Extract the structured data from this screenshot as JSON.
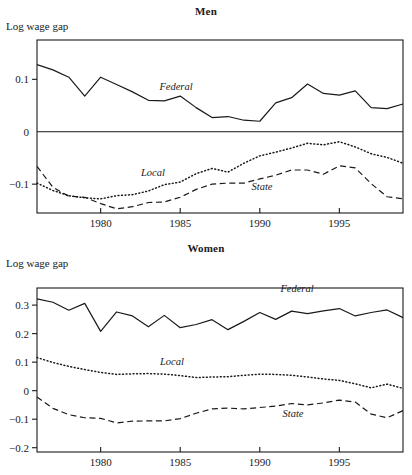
{
  "figure": {
    "background_color": "#ffffff",
    "line_color": "#1a1a1a",
    "panels": [
      {
        "id": "men",
        "title": "Men",
        "y_axis_label": "Log wage gap"
      },
      {
        "id": "women",
        "title": "Women",
        "y_axis_label": "Log wage gap"
      }
    ]
  },
  "chart_data": [
    {
      "type": "line",
      "title": "Men",
      "xlabel": "",
      "ylabel": "Log wage gap",
      "xlim": [
        1976,
        1999
      ],
      "ylim": [
        -0.155,
        0.175
      ],
      "xticks": [
        1980,
        1985,
        1990,
        1995
      ],
      "xtick_labels": [
        "1980",
        "1985",
        "1990",
        "1995"
      ],
      "yticks": [
        0.1,
        0,
        -0.1
      ],
      "ytick_labels": [
        "0.1",
        "0",
        "-0.1"
      ],
      "grid": false,
      "legend_position": "inline-annotations",
      "zero_line": true,
      "x": [
        1976,
        1977,
        1978,
        1979,
        1980,
        1981,
        1982,
        1983,
        1984,
        1985,
        1986,
        1987,
        1988,
        1989,
        1990,
        1991,
        1992,
        1993,
        1994,
        1995,
        1996,
        1997,
        1998,
        1999
      ],
      "series": [
        {
          "name": "Federal",
          "style": "solid",
          "values": [
            0.128,
            0.118,
            0.104,
            0.068,
            0.104,
            0.09,
            0.076,
            0.06,
            0.059,
            0.068,
            0.046,
            0.027,
            0.029,
            0.022,
            0.02,
            0.055,
            0.065,
            0.091,
            0.073,
            0.07,
            0.078,
            0.046,
            0.044,
            0.053
          ]
        },
        {
          "name": "Local",
          "style": "dotted",
          "values": [
            -0.098,
            -0.112,
            -0.122,
            -0.126,
            -0.128,
            -0.122,
            -0.12,
            -0.113,
            -0.101,
            -0.096,
            -0.08,
            -0.07,
            -0.077,
            -0.06,
            -0.046,
            -0.039,
            -0.031,
            -0.022,
            -0.025,
            -0.019,
            -0.029,
            -0.042,
            -0.049,
            -0.06
          ]
        },
        {
          "name": "State",
          "style": "dashed",
          "values": [
            -0.066,
            -0.106,
            -0.123,
            -0.125,
            -0.137,
            -0.147,
            -0.143,
            -0.135,
            -0.134,
            -0.125,
            -0.11,
            -0.1,
            -0.098,
            -0.098,
            -0.09,
            -0.083,
            -0.073,
            -0.073,
            -0.081,
            -0.065,
            -0.069,
            -0.099,
            -0.124,
            -0.128
          ]
        }
      ]
    },
    {
      "type": "line",
      "title": "Women",
      "xlabel": "",
      "ylabel": "Log wage gap",
      "xlim": [
        1976,
        1999
      ],
      "ylim": [
        -0.215,
        0.36
      ],
      "xticks": [
        1980,
        1985,
        1990,
        1995
      ],
      "xtick_labels": [
        "1980",
        "1985",
        "1990",
        "1995"
      ],
      "yticks": [
        0.3,
        0.2,
        0.1,
        0,
        -0.1,
        -0.2
      ],
      "ytick_labels": [
        "0.3",
        "0.2",
        "0.1",
        "0",
        "-0.1",
        "-0.2"
      ],
      "grid": false,
      "legend_position": "inline-annotations",
      "zero_line": false,
      "x": [
        1976,
        1977,
        1978,
        1979,
        1980,
        1981,
        1982,
        1983,
        1984,
        1985,
        1986,
        1987,
        1988,
        1989,
        1990,
        1991,
        1992,
        1993,
        1994,
        1995,
        1996,
        1997,
        1998,
        1999
      ],
      "series": [
        {
          "name": "Federal",
          "style": "solid",
          "values": [
            0.322,
            0.31,
            0.282,
            0.306,
            0.208,
            0.276,
            0.262,
            0.224,
            0.264,
            0.221,
            0.232,
            0.249,
            0.214,
            0.243,
            0.274,
            0.25,
            0.279,
            0.27,
            0.28,
            0.288,
            0.262,
            0.274,
            0.283,
            0.256
          ]
        },
        {
          "name": "Local",
          "style": "dotted",
          "values": [
            0.116,
            0.099,
            0.085,
            0.074,
            0.064,
            0.057,
            0.059,
            0.06,
            0.058,
            0.053,
            0.046,
            0.048,
            0.049,
            0.054,
            0.058,
            0.057,
            0.054,
            0.048,
            0.041,
            0.036,
            0.024,
            0.01,
            0.023,
            0.008
          ]
        },
        {
          "name": "State",
          "style": "dashed",
          "values": [
            -0.022,
            -0.062,
            -0.084,
            -0.095,
            -0.097,
            -0.113,
            -0.107,
            -0.106,
            -0.106,
            -0.098,
            -0.079,
            -0.064,
            -0.061,
            -0.064,
            -0.059,
            -0.054,
            -0.045,
            -0.05,
            -0.043,
            -0.033,
            -0.04,
            -0.082,
            -0.095,
            -0.07
          ]
        }
      ]
    }
  ]
}
